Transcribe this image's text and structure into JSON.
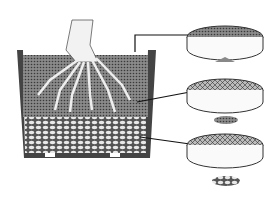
{
  "figure": {
    "parts": [
      {
        "id": "pot",
        "label": "pot cross-section"
      },
      {
        "id": "tree-trunk",
        "label": "trunk with roots"
      },
      {
        "id": "fine-layer",
        "label": "fine soil surface layer"
      },
      {
        "id": "medium-layer",
        "label": "medium granular soil layer"
      },
      {
        "id": "coarse-layer",
        "label": "coarse drainage layer"
      },
      {
        "id": "sieve-fine",
        "label": "fine mesh sieve"
      },
      {
        "id": "sieve-medium",
        "label": "medium mesh sieve"
      },
      {
        "id": "sieve-coarse",
        "label": "coarse mesh sieve"
      }
    ],
    "colors": {
      "ink": "#222222",
      "soil": "#6a6a6a",
      "bg": "#ffffff"
    }
  }
}
